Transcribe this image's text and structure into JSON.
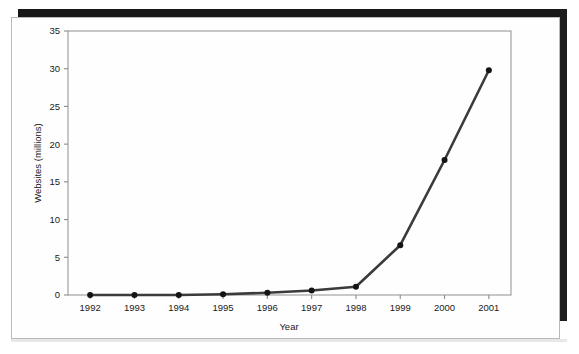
{
  "figure": {
    "background_color": "#ffffff",
    "frame_color": "#b9b9b9",
    "scan_bar_color": "#171717"
  },
  "chart_data": {
    "type": "line",
    "title": "",
    "xlabel": "Year",
    "ylabel": "Websites (millions)",
    "categories": [
      "1992",
      "1993",
      "1994",
      "1995",
      "1996",
      "1997",
      "1998",
      "1999",
      "2000",
      "2001"
    ],
    "values": [
      0.0,
      0.0,
      0.0,
      0.1,
      0.3,
      0.6,
      1.1,
      6.6,
      17.9,
      29.8
    ],
    "x": [
      1992,
      1993,
      1994,
      1995,
      1996,
      1997,
      1998,
      1999,
      2000,
      2001
    ],
    "xlim": [
      1991.6,
      2001.4
    ],
    "ylim": [
      0,
      35
    ],
    "yticks": [
      0,
      5,
      10,
      15,
      20,
      25,
      30,
      35
    ],
    "ytick_labels": [
      "0",
      "5",
      "10",
      "15",
      "20",
      "25",
      "30",
      "35"
    ],
    "xtick_labels": [
      "1992",
      "1993",
      "1994",
      "1995",
      "1996",
      "1997",
      "1998",
      "1999",
      "2000",
      "2001"
    ],
    "grid": false,
    "legend": null,
    "legend_position": "none",
    "marker": "circle",
    "line_color": "#3b3b3b",
    "marker_color": "#141414",
    "series": [
      {
        "name": "Websites",
        "values": [
          0.0,
          0.0,
          0.0,
          0.1,
          0.3,
          0.6,
          1.1,
          6.6,
          17.9,
          29.8
        ]
      }
    ]
  }
}
